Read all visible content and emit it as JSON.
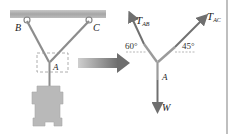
{
  "figure": {
    "left_panel": {
      "support_labels": {
        "b": "B",
        "c": "C"
      },
      "joint_label": "A"
    },
    "transition_arrow": {
      "direction": "right"
    },
    "free_body_diagram": {
      "forces": [
        {
          "name": "T",
          "sub": "AB",
          "angle_label": "60°"
        },
        {
          "name": "T",
          "sub": "AC",
          "angle_label": "45°"
        },
        {
          "name": "W",
          "sub": ""
        }
      ],
      "joint_label": "A"
    }
  },
  "colors": {
    "ceiling": "#a8a8a8",
    "cable": "#8a8a8a",
    "weight": "#b8b8b8",
    "arrow": "#7a7a7a",
    "force_arrow": "#707070",
    "dashed_box": "#999999",
    "border": "#aaaaaa"
  }
}
